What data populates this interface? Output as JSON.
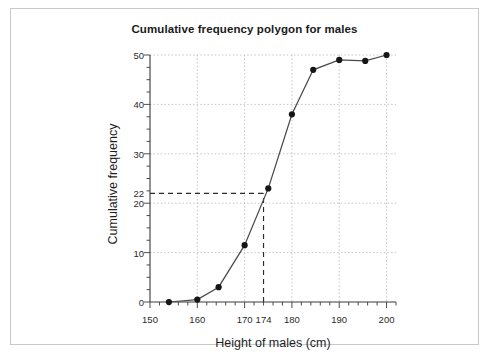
{
  "chart_data": {
    "type": "line",
    "title": "Cumulative frequency polygon for males",
    "xlabel": "Height of males (cm)",
    "ylabel": "Cumulative frequency",
    "xlim": [
      150,
      202
    ],
    "ylim": [
      0,
      50
    ],
    "grid": true,
    "legend": "none",
    "x_ticks": [
      150,
      160,
      170,
      174,
      180,
      190,
      200
    ],
    "x_tick_labels": [
      "150",
      "160",
      "170",
      "174",
      "180",
      "190",
      "200"
    ],
    "y_ticks": [
      0,
      10,
      20,
      22,
      30,
      40,
      50
    ],
    "y_tick_labels": [
      "0",
      "10",
      "20",
      "22",
      "30",
      "40",
      "50"
    ],
    "y_gridlines": [
      10,
      20,
      30,
      40,
      50
    ],
    "x_gridlines": [
      160,
      170,
      180,
      190,
      200
    ],
    "series": [
      {
        "name": "Cumulative frequency of male heights",
        "marker": "filled-circle",
        "points": [
          {
            "x": 154.0,
            "y": 0.0
          },
          {
            "x": 160.0,
            "y": 0.5
          },
          {
            "x": 164.5,
            "y": 3.0
          },
          {
            "x": 170.0,
            "y": 11.5
          },
          {
            "x": 175.0,
            "y": 23.0
          },
          {
            "x": 180.0,
            "y": 38.0
          },
          {
            "x": 184.5,
            "y": 47.0
          },
          {
            "x": 190.0,
            "y": 49.0
          },
          {
            "x": 195.5,
            "y": 48.8
          },
          {
            "x": 200.0,
            "y": 50.0
          }
        ]
      }
    ],
    "annotations": [
      {
        "name": "median-read-off",
        "style": "dashed",
        "horizontal_y": 22,
        "horizontal_x_from": 150,
        "horizontal_x_to": 174,
        "vertical_x": 174,
        "vertical_y_from": 0,
        "vertical_y_to": 22,
        "label_y": "22",
        "label_x": "174"
      }
    ]
  }
}
